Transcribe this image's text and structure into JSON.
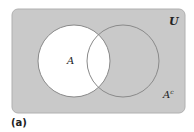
{
  "diagram": {
    "type": "venn",
    "universe_label": "U",
    "set_label": "A",
    "complement_label_base": "A",
    "complement_label_sup": "c",
    "caption": "(a)",
    "shaded_region": "complement of A",
    "colors": {
      "universe_fill": "#c9c9c9",
      "universe_border": "#b0b0b0",
      "set_fill": "#ffffff",
      "circle_stroke": "#8a8a8a",
      "text": "#222222"
    },
    "geometry": {
      "universe_rect": {
        "x": 12,
        "y": 9,
        "w": 173,
        "h": 104,
        "rx": 6
      },
      "circle_a": {
        "cx": 74,
        "cy": 61,
        "r": 36
      },
      "circle_b": {
        "cx": 123,
        "cy": 61,
        "r": 36
      }
    }
  }
}
